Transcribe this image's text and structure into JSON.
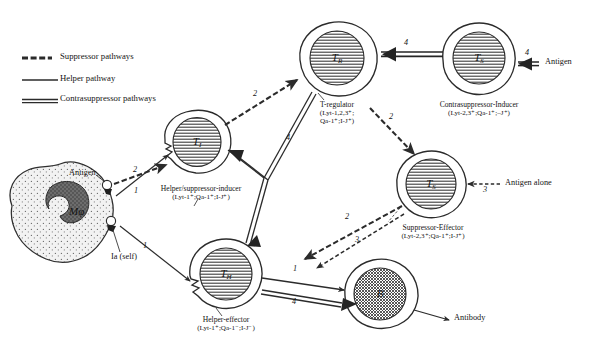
{
  "legend": {
    "items": [
      {
        "key": "suppressor",
        "label": "Suppressor pathways",
        "style": "dashed-thick",
        "color": "#2b2b2b"
      },
      {
        "key": "helper",
        "label": "Helper pathway",
        "style": "solid-thin",
        "color": "#2b2b2b"
      },
      {
        "key": "contrasuppressor",
        "label": "Contrasuppressor pathways",
        "style": "double-thick",
        "color": "#2b2b2b"
      }
    ]
  },
  "cells": {
    "macrophage": {
      "tag": "Mφ",
      "name": "",
      "pheno": "",
      "type": "macrophage"
    },
    "t_inducer": {
      "tag": "T",
      "tag_sub": "I",
      "name": "Helper/suppressor-inducer",
      "pheno": "(Lyt-1⁺;Qa-1⁺;I-J⁺)"
    },
    "t_regulator": {
      "tag": "T",
      "tag_sub": "R",
      "name": "T-regulator",
      "pheno_line1": "(Lyt-1,2,3⁺;",
      "pheno_line2": "Qa-1⁺;I-J⁺)"
    },
    "contrasuppressor_inducer": {
      "tag": "T",
      "tag_sub": "S",
      "name": "Contrasuppressor-Inducer",
      "pheno": "(Lyt-2,3⁺;Qa-1⁺;–J⁺)"
    },
    "suppressor_effector": {
      "tag": "T",
      "tag_sub": "S",
      "name": "Suppressor-Effector",
      "pheno": "(Lyt-2,3⁺;Qa-1⁺;I-J⁺)"
    },
    "helper_effector": {
      "tag": "T",
      "tag_sub": "H",
      "name": "Helper-effector",
      "pheno": "(Lyt-1⁺;Qa-1⁻;I-J⁻)"
    },
    "b_cell": {
      "tag": "B",
      "name": "",
      "pheno": ""
    }
  },
  "annotations": {
    "antigen_macrophage": "Antigen",
    "ia_self": "Ia (self)",
    "antigen_right": "Antigen",
    "antigen_alone": "Antigen alone",
    "antibody": "Antibody"
  },
  "pathway_numbers": {
    "mac_to_ti_suppressor": "2",
    "mac_to_ti_helper": "1",
    "mac_to_th_helper": "1",
    "ti_to_tr_suppressor": "2",
    "tr_to_se_suppressor": "2",
    "tr_contrasuppressor": "4",
    "csi_to_tr": "4",
    "antigen_right": "4",
    "antigen_alone": "3",
    "se_to_th_a": "2",
    "se_to_th_b": "3",
    "th_to_b_helper": "1",
    "th_to_b_contra": "4"
  },
  "colors": {
    "ink": "#1a1a1a",
    "line": "#2b2b2b",
    "nucleus": "#595959",
    "cytoplasm": "#ededed",
    "background": "#ffffff"
  }
}
